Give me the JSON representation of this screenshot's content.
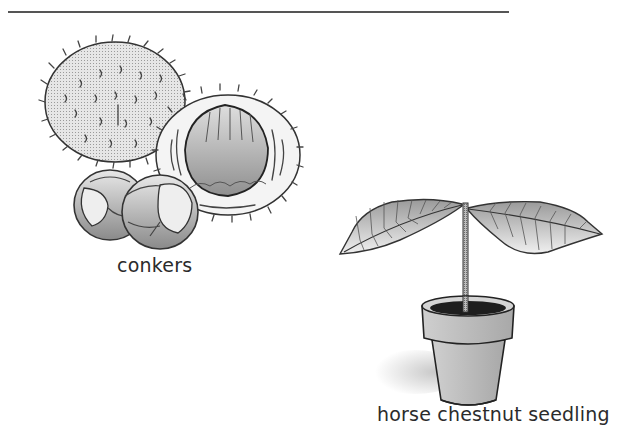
{
  "page": {
    "rule_color": "#555555",
    "ink_color": "#2b2b2b"
  },
  "illustrations": [
    {
      "id": "conkers",
      "caption": "conkers",
      "parts": [
        "spiky-husk",
        "open-husk-with-nut",
        "conker-left",
        "conker-right"
      ]
    },
    {
      "id": "seedling",
      "caption": "horse chestnut seedling",
      "parts": [
        "left-leaf",
        "right-leaf",
        "stem",
        "flower-pot",
        "soil",
        "shadow"
      ]
    }
  ]
}
